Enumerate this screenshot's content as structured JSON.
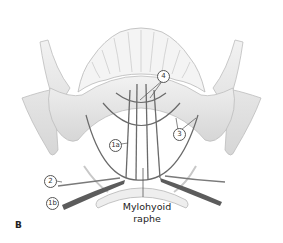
{
  "figure": {
    "panel_label": "B",
    "caption_line1": "Mylohyoid",
    "caption_line2": "raphe",
    "labels": [
      {
        "id": "4",
        "text": "4",
        "x": 160,
        "y": 70
      },
      {
        "id": "3",
        "text": "3",
        "x": 174,
        "y": 125
      },
      {
        "id": "1a",
        "text": "1a",
        "x": 110,
        "y": 138
      },
      {
        "id": "2",
        "text": "2",
        "x": 44,
        "y": 176
      },
      {
        "id": "1b",
        "text": "1b",
        "x": 46,
        "y": 197
      }
    ],
    "colors": {
      "bone": "#e4e4e4",
      "bone_shadow": "#c9c9c9",
      "muscle_line": "#6a6a6a",
      "muscle_dark": "#555555",
      "label_stroke": "#555555"
    }
  }
}
